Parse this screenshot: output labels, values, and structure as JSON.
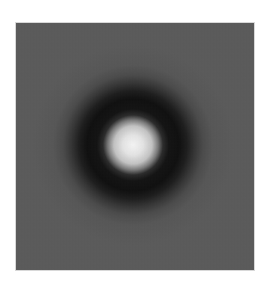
{
  "image": {
    "description": "Grayscale center-surround (difference-of-Gaussians) pattern: bright central spot surrounded by a dark annulus over a noisy medium-gray field",
    "colors": {
      "background_page": "#ffffff",
      "field_gray": "#5a5a5a",
      "ring_dark": "#0e0e0e",
      "center_bright": "#f4f4f4"
    },
    "center": {
      "x": 133,
      "y": 145
    },
    "center_radius_px": 26,
    "ring_outer_radius_px": 62
  }
}
